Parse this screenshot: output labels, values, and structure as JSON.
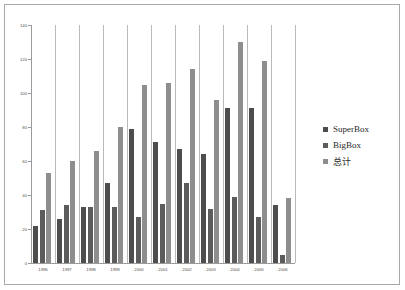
{
  "chart_data": {
    "type": "bar",
    "title": "",
    "subtitle": "",
    "xlabel": "",
    "ylabel": "",
    "grid": false,
    "legend_position": "right",
    "ylim": [
      0,
      140
    ],
    "ytick_labels": [
      "140",
      "120",
      "100",
      "80",
      "60",
      "40",
      "20",
      "0"
    ],
    "yticks": [
      140,
      120,
      100,
      80,
      60,
      40,
      20,
      0
    ],
    "categories": [
      "1996",
      "1997",
      "1998",
      "1999",
      "2000",
      "2001",
      "2002",
      "2003",
      "2004",
      "2005",
      "2006"
    ],
    "series": [
      {
        "name": "SuperBox",
        "color": "#4d4d4d",
        "values": [
          22,
          26,
          33,
          47,
          79,
          71,
          67,
          64,
          91,
          91,
          34
        ]
      },
      {
        "name": "BigBox",
        "color": "#5c5c5c",
        "values": [
          31,
          34,
          33,
          33,
          27,
          35,
          47,
          32,
          39,
          27,
          5
        ]
      },
      {
        "name": "总计",
        "color": "#8e8e8e",
        "values": [
          53,
          60,
          66,
          80,
          105,
          106,
          114,
          96,
          130,
          119,
          38
        ]
      }
    ]
  },
  "legend": {
    "items": [
      {
        "label": "SuperBox",
        "color": "#4d4d4d"
      },
      {
        "label": "BigBox",
        "color": "#5c5c5c"
      },
      {
        "label": "总计",
        "color": "#8e8e8e"
      }
    ]
  }
}
